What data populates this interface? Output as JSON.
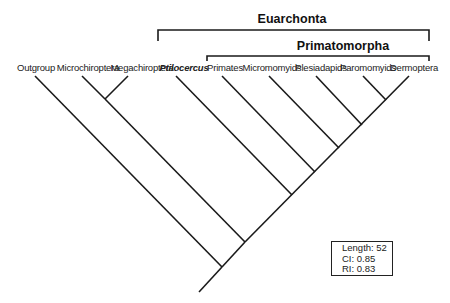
{
  "diagram": {
    "type": "cladogram",
    "clades": [
      {
        "label": "Euarchonta",
        "bracket_from": "Ptilocercus",
        "bracket_to": "Dermoptera"
      },
      {
        "label": "Primatomorpha",
        "bracket_from": "Primates",
        "bracket_to": "Dermoptera"
      }
    ],
    "taxa": [
      {
        "label": "Outgroup",
        "italic": false
      },
      {
        "label": "Microchiroptera",
        "italic": false
      },
      {
        "label": "Megachiroptera",
        "italic": false
      },
      {
        "label": "Ptilocercus",
        "italic": true
      },
      {
        "label": "Primates",
        "italic": false
      },
      {
        "label": "Micromomyids",
        "italic": false
      },
      {
        "label": "Plesiadapids",
        "italic": false
      },
      {
        "label": "Paromomyids",
        "italic": false
      },
      {
        "label": "Dermoptera",
        "italic": false
      }
    ],
    "topology": "(Outgroup,((Microchiroptera,Megachiroptera),(Ptilocercus,(Primates,(Micromomyids,(Plesiadapids,(Paromomyids,Dermoptera)))))))",
    "stats": {
      "length": "Length: 52",
      "ci": "CI: 0.85",
      "ri": "RI: 0.83"
    }
  }
}
